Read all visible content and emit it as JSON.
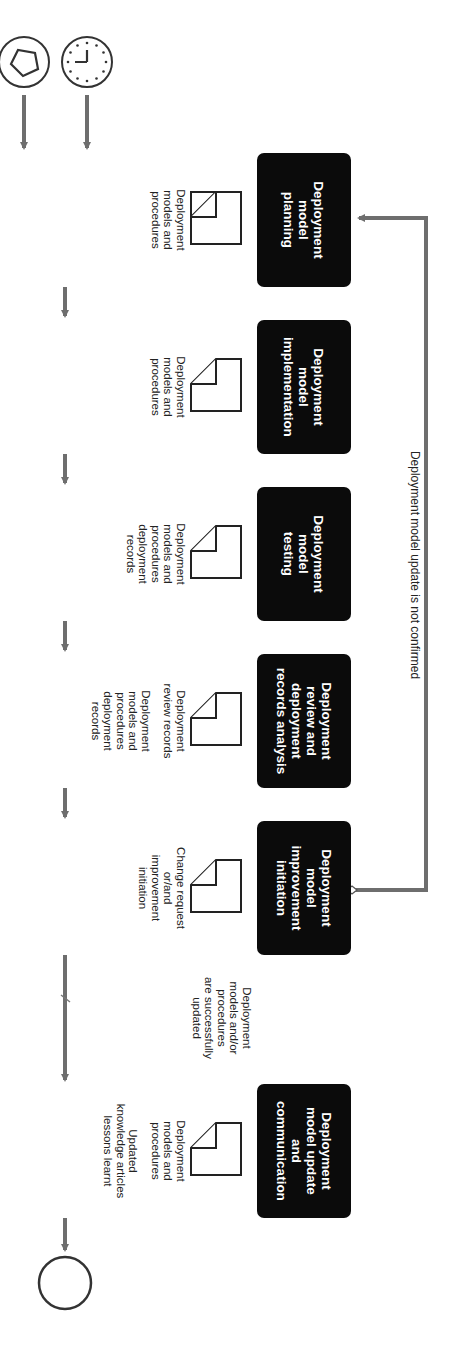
{
  "diagram": {
    "orientation": "rotated 90 degrees clockwise",
    "colors": {
      "box_fill": "#0b0b0b",
      "box_text": "#ffffff",
      "arrow": "#6e6e6e",
      "outline": "#333333"
    },
    "start_events": [
      {
        "id": "start-trigger",
        "icon": "pentagon-icon"
      },
      {
        "id": "start-timer",
        "icon": "clock-icon"
      }
    ],
    "end_event": {
      "id": "end",
      "icon": "circle-end-icon"
    },
    "process_steps": [
      {
        "lines": [
          "Deployment",
          "model",
          "planning"
        ]
      },
      {
        "lines": [
          "Deployment",
          "model",
          "implementation"
        ]
      },
      {
        "lines": [
          "Deployment",
          "model",
          "testing"
        ]
      },
      {
        "lines": [
          "Deployment",
          "review and",
          "deployment",
          "records analysis"
        ]
      },
      {
        "lines": [
          "Deployment",
          "model",
          "improvement",
          "initiation"
        ]
      },
      {
        "lines": [
          "Deployment",
          "model update",
          "and",
          "communication"
        ]
      }
    ],
    "outputs": [
      {
        "lines": [
          "Deployment",
          "models and",
          "procedures"
        ]
      },
      {
        "lines": [
          "Deployment",
          "models and",
          "procedures"
        ]
      },
      {
        "lines": [
          "Deployment",
          "models and",
          "procedures",
          "deployment",
          "records"
        ]
      },
      {
        "lines": [
          "Deployment",
          "review records",
          "",
          "Deployment",
          "models and",
          "procedures",
          "deployment",
          "records"
        ]
      },
      {
        "lines": [
          "Change request",
          "or/and",
          "improvement",
          "initiation"
        ]
      },
      {
        "lines": [
          "Deployment",
          "models and",
          "procedures",
          "",
          "Updated",
          "knowledge articles",
          "lessons learnt"
        ]
      }
    ],
    "conditions": {
      "feedback_loop": "Deployment model update is not confirmed",
      "success_lines": [
        "Deployment",
        "models and/or",
        "procedures",
        "are successfully",
        "updated"
      ]
    }
  }
}
